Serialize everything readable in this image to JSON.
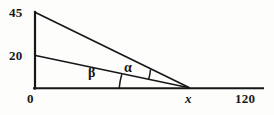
{
  "figure": {
    "kind": "geometry-diagram",
    "stroke_color": "#17171a",
    "background_color": "#fdfdfb",
    "labels": {
      "top_left_value": "45",
      "mid_left_value": "20",
      "origin_value": "0",
      "unknown_point": "x",
      "baseline_end_value": "120",
      "angle_upper": "α",
      "angle_lower": "β"
    },
    "geometry": {
      "origin": [
        35,
        88
      ],
      "apex_top": [
        35,
        12
      ],
      "mid_point": [
        35,
        55
      ],
      "vertex_x": [
        189,
        88
      ],
      "baseline_end": [
        263,
        88
      ],
      "vertical_axis_height_units": 45,
      "mid_height_units": 20,
      "baseline_total_units": 120
    }
  }
}
